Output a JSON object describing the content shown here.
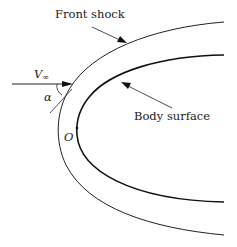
{
  "diagram": {
    "labels": {
      "front_shock": "Front shock",
      "body_surface": "Body surface",
      "velocity_symbol": "V",
      "velocity_subscript": "∞",
      "angle": "α",
      "origin": "O"
    },
    "colors": {
      "line": "#222222",
      "background": "#ffffff"
    }
  }
}
